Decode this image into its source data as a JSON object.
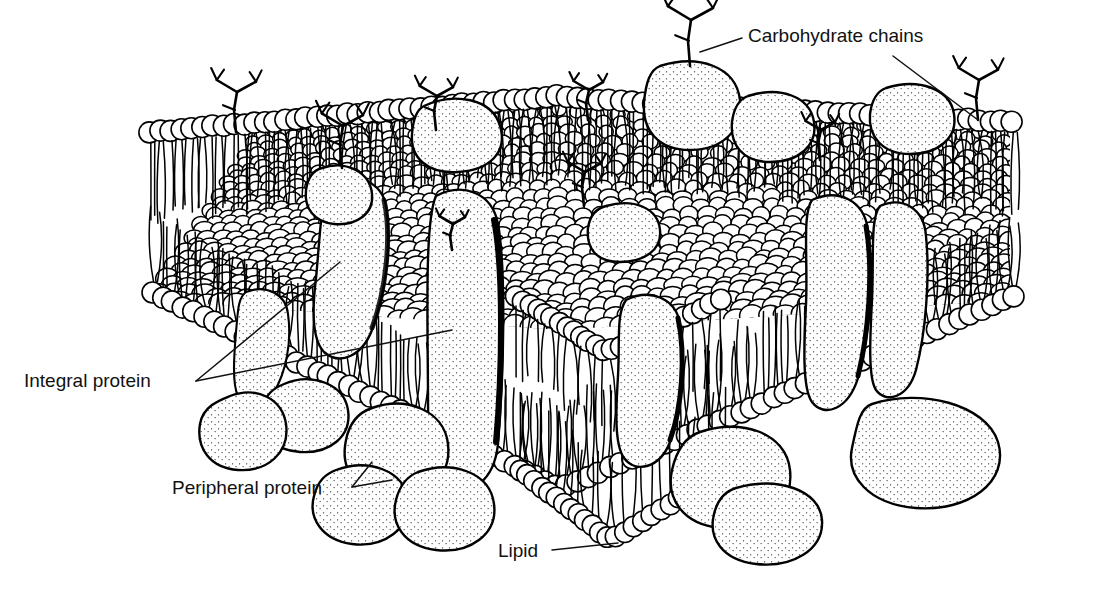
{
  "figure": {
    "domain": "biology-diagram",
    "style": "black-and-white line drawing, stippled shading",
    "background_color": "#ffffff",
    "ink_color": "#000000",
    "view": "three-dimensional cutaway block, front-left and front-right cut faces visible"
  },
  "labels": [
    {
      "id": "carbohydrate-chains",
      "text": "Carbohydrate chains",
      "x": 748,
      "y": 42,
      "anchor": "start",
      "leaders": [
        {
          "from": [
            742,
            38
          ],
          "to": [
            700,
            52
          ]
        },
        {
          "from": [
            893,
            56
          ],
          "to": [
            978,
            120
          ]
        }
      ]
    },
    {
      "id": "integral-protein",
      "text": "Integral protein",
      "x": 24,
      "y": 387,
      "anchor": "start",
      "leaders": [
        {
          "from": [
            196,
            381
          ],
          "to": [
            340,
            262
          ]
        },
        {
          "from": [
            196,
            381
          ],
          "to": [
            452,
            330
          ]
        }
      ]
    },
    {
      "id": "peripheral-protein",
      "text": "Peripheral protein",
      "x": 172,
      "y": 494,
      "anchor": "start",
      "leaders": [
        {
          "from": [
            352,
            487
          ],
          "to": [
            372,
            462
          ]
        },
        {
          "from": [
            352,
            487
          ],
          "to": [
            392,
            480
          ]
        }
      ]
    },
    {
      "id": "lipid",
      "text": "Lipid",
      "x": 498,
      "y": 557,
      "anchor": "start",
      "leaders": [
        {
          "from": [
            552,
            550
          ],
          "to": [
            618,
            543
          ]
        }
      ]
    }
  ],
  "components": {
    "lipid_bilayer": {
      "name": "phospholipid bilayer",
      "head_shape": "circle",
      "head_fill": "#ffffff",
      "tail_style": "thin wavy hairlines",
      "leaflets": 2
    },
    "integral_proteins": {
      "name": "integral (transmembrane) proteins",
      "count": 6,
      "fill": "#ffffff",
      "shading": "stipple dots with dark margins",
      "description": "elongated blobs spanning the full bilayer"
    },
    "peripheral_proteins": {
      "name": "peripheral proteins",
      "count": 5,
      "fill": "#ffffff",
      "shading": "stipple dots",
      "description": "lobed blobs attached beneath the inner leaflet"
    },
    "carbohydrate_chains": {
      "name": "carbohydrate chains",
      "count": 9,
      "description": "branching antler-like oligosaccharides on the outer surface"
    },
    "surface_proteins": {
      "name": "surface-embedded globular proteins",
      "count": 6,
      "description": "domed blobs rising above the outer leaflet"
    }
  },
  "surface": {
    "outer_leaflet_label": "outer (extracellular) surface — packed lipid head groups",
    "inner_leaflet_label": "inner (cytoplasmic) surface"
  }
}
